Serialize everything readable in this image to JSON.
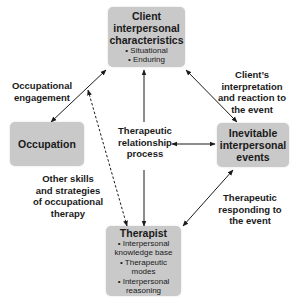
{
  "nodes": {
    "client": {
      "title": "Client interpersonal characteristics",
      "title_lines": [
        "Client",
        "interpersonal",
        "characteristics"
      ],
      "items": [
        "• Situational",
        "• Enduring"
      ]
    },
    "occupation": {
      "title": "Occupation"
    },
    "events": {
      "title": "Inevitable interpersonal events",
      "title_lines": [
        "Inevitable",
        "interpersonal",
        "events"
      ]
    },
    "therapist": {
      "title": "Therapist",
      "items": [
        "• Interpersonal",
        "knowledge base",
        "• Therapeutic",
        "modes",
        "• Interpersonal",
        "reasoning"
      ]
    },
    "center": {
      "lines": [
        "Therapeutic",
        "relationship",
        "process"
      ]
    }
  },
  "edge_labels": {
    "occupational_engagement": [
      "Occupational",
      "engagement"
    ],
    "client_interpretation": [
      "Client’s",
      "interpretation",
      "and reaction to",
      "the event"
    ],
    "other_skills": [
      "Other skills",
      "and strategies",
      "of occupational",
      "therapy"
    ],
    "therapeutic_responding": [
      "Therapeutic",
      "responding to",
      "the event"
    ]
  },
  "colors": {
    "box_fill": "#c9c9c9",
    "arrow": "#1a1a1a",
    "background": "#ffffff"
  }
}
